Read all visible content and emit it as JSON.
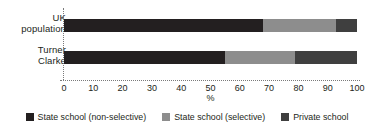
{
  "chart_data": {
    "type": "bar",
    "orientation": "horizontal",
    "stacked": true,
    "stack_mode": "percent",
    "title": "",
    "subtitle": "",
    "xlabel": "%",
    "ylabel": "",
    "categories": [
      "UK population",
      "Turner Clarke"
    ],
    "category_lines": [
      [
        "UK",
        "population"
      ],
      [
        "Turner",
        "Clarke"
      ]
    ],
    "series": [
      {
        "name": "State school (non-selective)",
        "color": "#231f20",
        "values": [
          68,
          55
        ]
      },
      {
        "name": "State school (selective)",
        "color": "#8d8d8d",
        "values": [
          25,
          24
        ]
      },
      {
        "name": "Private school",
        "color": "#3f3f3f",
        "values": [
          7,
          21
        ]
      }
    ],
    "xlim": [
      0,
      100
    ],
    "xticks": [
      0,
      10,
      20,
      30,
      40,
      50,
      60,
      70,
      80,
      90,
      100
    ],
    "xtick_labels": [
      "0",
      "10",
      "20",
      "30",
      "40",
      "50",
      "60",
      "70",
      "80",
      "90",
      "100"
    ],
    "grid": false,
    "axis_style": "dotted",
    "legend_position": "bottom",
    "legend": [
      "State school (non-selective)",
      "State school (selective)",
      "Private school"
    ]
  },
  "colors": {
    "non_selective": "#231f20",
    "selective": "#8d8d8d",
    "private": "#3f3f3f",
    "axis": "#7a7a7a",
    "text": "#231f20",
    "background": "#ffffff"
  }
}
